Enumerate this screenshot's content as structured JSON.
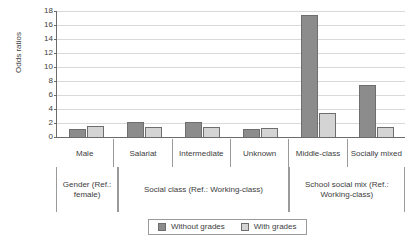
{
  "chart_data": {
    "type": "bar",
    "title": "",
    "xlabel": "",
    "ylabel": "Odds ratios",
    "ylim": [
      0,
      18
    ],
    "yticks": [
      0,
      2,
      4,
      6,
      8,
      10,
      12,
      14,
      16,
      18
    ],
    "grid": true,
    "legend_position": "bottom",
    "categories": [
      "Male",
      "Salariat",
      "Intermediate",
      "Unknown",
      "Middle-class",
      "Socially mixed"
    ],
    "groups": [
      {
        "label": "Gender (Ref.: female)",
        "categories": [
          "Male"
        ]
      },
      {
        "label": "Social class (Ref.: Working-class)",
        "categories": [
          "Salariat",
          "Intermediate",
          "Unknown"
        ]
      },
      {
        "label": "School social mix (Ref.: Working-class)",
        "categories": [
          "Middle-class",
          "Socially mixed"
        ]
      }
    ],
    "series": [
      {
        "name": "Without grades",
        "color": "#8c8c8c",
        "values": [
          1.1,
          2.1,
          2.1,
          1.2,
          17.5,
          7.5
        ]
      },
      {
        "name": "With grades",
        "color": "#d4d4d4",
        "values": [
          1.6,
          1.4,
          1.4,
          1.3,
          3.5,
          1.5
        ]
      }
    ]
  },
  "legend": {
    "items": [
      {
        "label": "Without grades",
        "color": "#8c8c8c"
      },
      {
        "label": "With grades",
        "color": "#d4d4d4"
      }
    ]
  },
  "colors": {
    "without_grades": "#8c8c8c",
    "with_grades": "#d4d4d4",
    "axis": "#6b6b6b",
    "grid": "#d9d9d9",
    "text": "#3d3d3d"
  }
}
